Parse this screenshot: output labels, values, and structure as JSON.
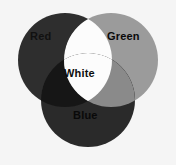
{
  "figure": {
    "background_color": "#f5f5f5"
  },
  "chart_data": {
    "type": "venn",
    "sets": [
      {
        "id": "red",
        "label": "Red",
        "fill": "#2e2e2e",
        "center_x": 65,
        "center_y": 60,
        "radius": 47
      },
      {
        "id": "green",
        "label": "Green",
        "fill": "#9b9b9b",
        "center_x": 111,
        "center_y": 60,
        "radius": 47
      },
      {
        "id": "blue",
        "label": "Blue",
        "fill": "#2a2a2a",
        "center_x": 88,
        "center_y": 100,
        "radius": 47
      }
    ],
    "intersections": [
      {
        "id": "red-green",
        "label": "White",
        "fill": "#fcfcfc"
      },
      {
        "id": "red-blue",
        "label": "",
        "fill": "#161616"
      },
      {
        "id": "green-blue",
        "label": "",
        "fill": "#8a8a8a"
      },
      {
        "id": "red-green-blue",
        "label": "White",
        "fill": "#fcfcfc"
      }
    ],
    "labels": [
      {
        "id": "red",
        "text": "Red",
        "x": 30,
        "y": 31
      },
      {
        "id": "green",
        "text": "Green",
        "x": 107,
        "y": 31
      },
      {
        "id": "blue",
        "text": "Blue",
        "x": 73,
        "y": 110
      },
      {
        "id": "white",
        "text": "White",
        "x": 64,
        "y": 68
      }
    ],
    "legend": null,
    "grid": false
  },
  "labels": {
    "red": "Red",
    "green": "Green",
    "blue": "Blue",
    "white": "White"
  },
  "colors": {
    "background": "#f5f5f5",
    "red_circle": "#2e2e2e",
    "green_circle": "#9b9b9b",
    "blue_circle": "#2a2a2a",
    "red_green_overlap": "#fcfcfc",
    "red_blue_overlap": "#161616",
    "green_blue_overlap": "#8a8a8a",
    "center_overlap": "#fcfcfc",
    "label_text": "#0d0d0d"
  }
}
